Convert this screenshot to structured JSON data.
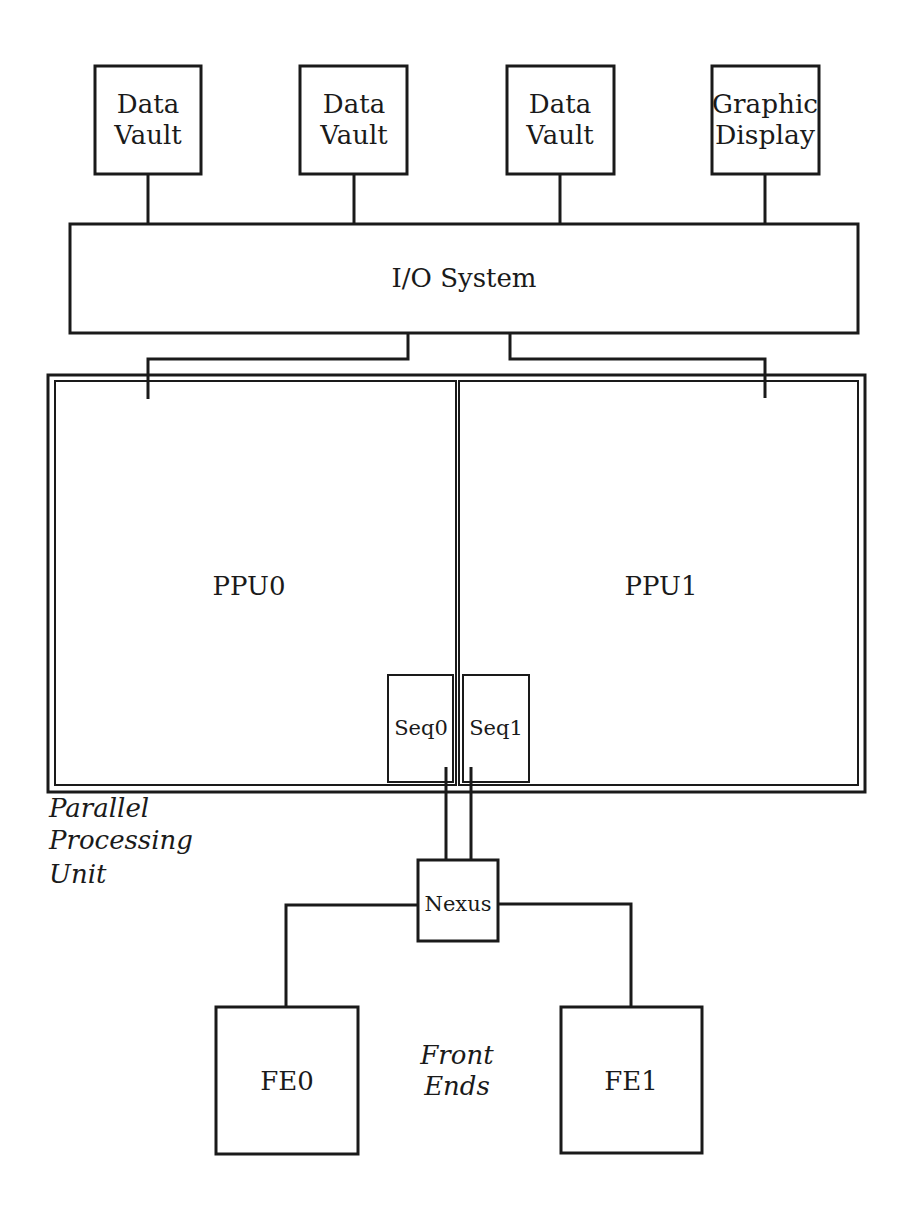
{
  "diagram": {
    "title": "",
    "stroke_color": "#1a1a1a",
    "background": "#ffffff",
    "top_devices": [
      {
        "line1": "Data",
        "line2": "Vault"
      },
      {
        "line1": "Data",
        "line2": "Vault"
      },
      {
        "line1": "Data",
        "line2": "Vault"
      },
      {
        "line1": "Graphic",
        "line2": "Display"
      }
    ],
    "io_system": {
      "label": "I/O System"
    },
    "ppu": {
      "caption_line1": "Parallel",
      "caption_line2": "Processing",
      "caption_line3": "Unit",
      "halves": [
        {
          "label": "PPU0",
          "sequencer": "Seq0"
        },
        {
          "label": "PPU1",
          "sequencer": "Seq1"
        }
      ]
    },
    "nexus": {
      "label": "Nexus"
    },
    "front_ends": {
      "caption_line1": "Front",
      "caption_line2": "Ends",
      "items": [
        {
          "label": "FE0"
        },
        {
          "label": "FE1"
        }
      ]
    }
  }
}
